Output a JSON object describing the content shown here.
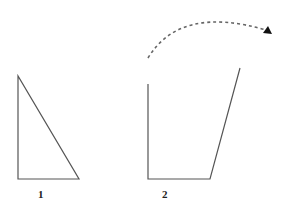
{
  "diagram": {
    "shapes": [
      {
        "id": "shape-1",
        "kind": "right-triangle",
        "label": "1",
        "points": [
          [
            18,
            76
          ],
          [
            18,
            179
          ],
          [
            79,
            179
          ]
        ],
        "label_pos": [
          41,
          195
        ]
      },
      {
        "id": "shape-2",
        "kind": "open-trapezoid",
        "label": "2",
        "points": [
          [
            148,
            84
          ],
          [
            148,
            179
          ],
          [
            210,
            179
          ],
          [
            240,
            68
          ]
        ],
        "label_pos": [
          165,
          195
        ]
      }
    ],
    "arrow": {
      "style": "dashed",
      "start": [
        148,
        58
      ],
      "control": [
        180,
        5
      ],
      "end": [
        272,
        34
      ],
      "description": "curved dashed arrow from shape 2 opening toward the upper right"
    },
    "colors": {
      "stroke": "#555555",
      "dash": "#666666",
      "arrowhead": "#111111"
    }
  }
}
